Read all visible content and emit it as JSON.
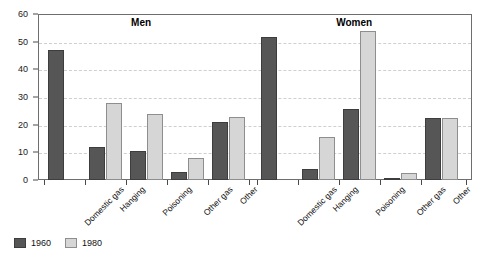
{
  "chart_data": {
    "type": "bar",
    "title": "",
    "xlabel": "",
    "ylabel": "",
    "ylim": [
      0,
      60
    ],
    "yticks": [
      0,
      10,
      20,
      30,
      40,
      50,
      60
    ],
    "ytick_labels": [
      "0",
      "10",
      "20",
      "30",
      "40",
      "50",
      "60"
    ],
    "grid": true,
    "legend_position": "bottom-left",
    "groups": [
      {
        "name": "Men",
        "categories": [
          "Domestic gas",
          "Hanging",
          "Poisoning",
          "Other gas",
          "Other"
        ],
        "series": [
          {
            "name": "1960",
            "values": [
              47,
              12,
              10.4,
              3,
              21
            ]
          },
          {
            "name": "1980",
            "values": [
              0,
              27.8,
              23.7,
              8,
              22.7
            ]
          }
        ]
      },
      {
        "name": "Women",
        "categories": [
          "Domestic gas",
          "Hanging",
          "Poisoning",
          "Other gas",
          "Other"
        ],
        "series": [
          {
            "name": "1960",
            "values": [
              51.8,
              4,
              25.6,
              0.6,
              22.3
            ]
          },
          {
            "name": "1980",
            "values": [
              0,
              15.5,
              53.8,
              2.5,
              22.3
            ]
          }
        ]
      }
    ],
    "legend": [
      {
        "label": "1960",
        "color": "#565656"
      },
      {
        "label": "1980",
        "color": "#d6d6d6"
      }
    ]
  },
  "colors": {
    "series_1960": "#565656",
    "series_1980": "#d6d6d6",
    "gridline": "#cfcfcf",
    "frame": "#6e6e6e",
    "text": "#111111"
  }
}
